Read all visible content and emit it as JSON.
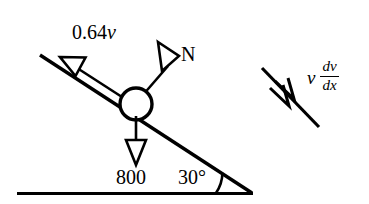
{
  "figure": {
    "type": "free-body-diagram",
    "background_color": "#ffffff",
    "ink_color": "#000000",
    "labels": {
      "friction_force": "0.64",
      "friction_force_variable": "v",
      "normal_force": "N",
      "weight": "800",
      "incline_angle": "30°",
      "acceleration_variable": "v",
      "acceleration_numerator": "dv",
      "acceleration_denominator": "dx"
    },
    "elements": {
      "ground_line": "ground-line",
      "incline_line": "incline-line",
      "block": "block-circle",
      "friction_vector": "friction-arrow",
      "normal_vector": "normal-arrow",
      "weight_vector": "weight-arrow",
      "angle_arc": "angle-arc",
      "acceleration_line": "acceleration-line",
      "acceleration_barbs": "acceleration-double-barb"
    },
    "geometry": {
      "incline_angle_degrees": 30,
      "ground_y": 193,
      "incline_start": [
        40,
        55
      ],
      "incline_end": [
        252,
        193
      ],
      "block_center": [
        136,
        104
      ],
      "block_radius": 16
    }
  }
}
